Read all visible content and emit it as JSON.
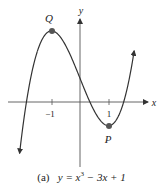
{
  "figure": {
    "caption_prefix": "(a)",
    "caption_lhs": "y",
    "caption_eq": " = x",
    "caption_exp": "3",
    "caption_rest": " − 3x + 1",
    "axis_x_label": "x",
    "axis_y_label": "y",
    "tick_neg1": "−1",
    "tick_pos1": "1",
    "point_max_label": "Q",
    "point_min_label": "P",
    "curve_color": "#333333",
    "point_color": "#555555"
  },
  "chart_data": {
    "type": "line",
    "xlabel": "x",
    "ylabel": "y",
    "function": "x^3 - 3x + 1",
    "x_ticks": [
      -1,
      1
    ],
    "points": [
      {
        "label": "Q",
        "x": -1,
        "y": 3,
        "kind": "local maximum"
      },
      {
        "label": "P",
        "x": 1,
        "y": -1,
        "kind": "local minimum"
      }
    ],
    "grid": false
  }
}
